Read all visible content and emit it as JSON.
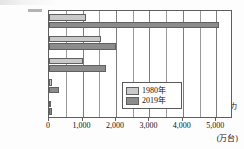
{
  "chart_data": {
    "type": "bar",
    "orientation": "horizontal",
    "title": "",
    "xlabel": "(万台)",
    "ylabel": "",
    "categories": [
      "ア",
      "イ",
      "ウ",
      "エ",
      "アフリカ"
    ],
    "series": [
      {
        "name": "1980年",
        "color": "#c9c9c9",
        "values": [
          1100,
          1550,
          1000,
          100,
          50
        ]
      },
      {
        "name": "2019年",
        "color": "#8c8c8c",
        "values": [
          5080,
          2000,
          1700,
          300,
          80
        ]
      }
    ],
    "xlim": [
      0,
      5500
    ],
    "xticks": [
      0,
      1000,
      2000,
      3000,
      4000,
      5000
    ],
    "xtick_labels": [
      "0",
      "1,000",
      "2,000",
      "3,000",
      "4,000",
      "5,000"
    ],
    "gridlines": [
      500,
      1000,
      1500,
      2000,
      2500,
      3000,
      3500,
      4000,
      4500,
      5000
    ],
    "grid": true,
    "legend_position": "bottom-right"
  },
  "axis": {
    "unit": "(万台)"
  },
  "legend": {
    "entries": [
      {
        "label": "1980年"
      },
      {
        "label": "2019年"
      }
    ]
  }
}
